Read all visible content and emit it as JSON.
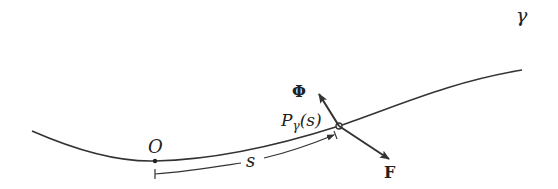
{
  "diagram": {
    "curve_label": "γ",
    "origin_label": "O",
    "arc_length_label": "s",
    "point_label_main": "P",
    "point_label_sub": "γ",
    "point_label_arg": "(s)",
    "vector_phi_label": "Φ",
    "vector_f_label": "F",
    "colors": {
      "stroke": "#333333",
      "background": "#ffffff"
    }
  }
}
